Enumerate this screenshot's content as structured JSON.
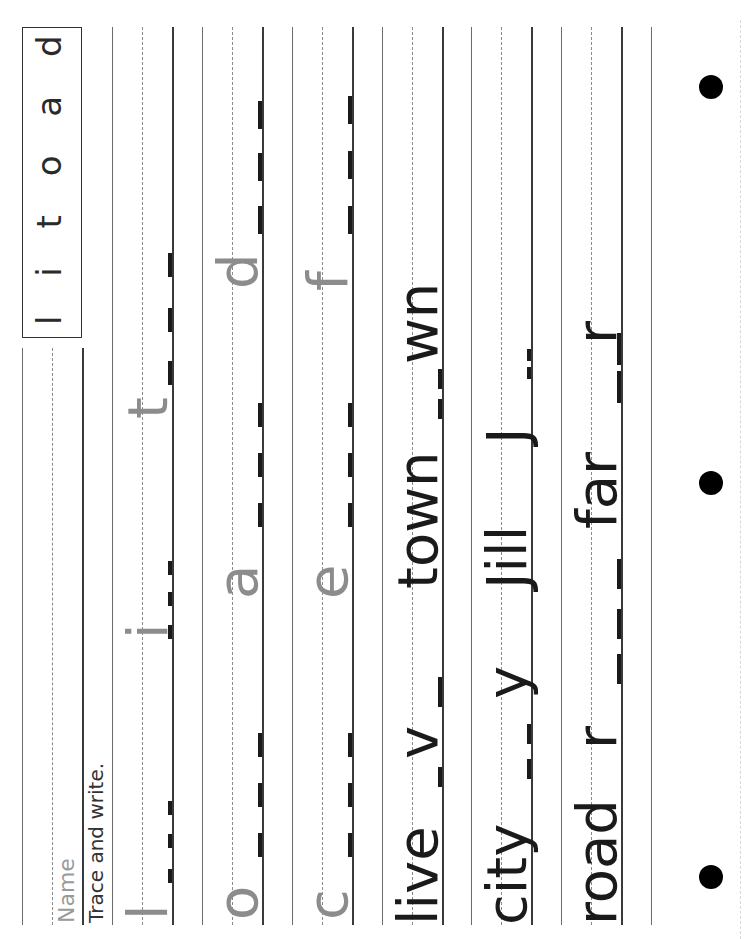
{
  "worksheet": {
    "letter_box": "l i t o a d c e f",
    "name_label": "Name",
    "instruction": "Trace and write."
  },
  "rows": [
    {
      "id": "row-1",
      "items": [
        {
          "text": "l",
          "style": "gray",
          "pos": 19
        },
        {
          "text": "i",
          "style": "gray",
          "pos": 300
        },
        {
          "text": "t",
          "style": "gray",
          "pos": 520
        }
      ]
    },
    {
      "id": "row-2",
      "items": [
        {
          "text": "o",
          "style": "gray",
          "pos": 19
        },
        {
          "text": "a",
          "style": "gray",
          "pos": 340
        },
        {
          "text": "d",
          "style": "gray",
          "pos": 650
        }
      ]
    },
    {
      "id": "row-3",
      "items": [
        {
          "text": "c",
          "style": "gray",
          "pos": 19
        },
        {
          "text": "e",
          "style": "gray",
          "pos": 340
        },
        {
          "text": "f",
          "style": "gray",
          "pos": 648
        }
      ]
    },
    {
      "id": "row-4",
      "items": [
        {
          "text": "live",
          "style": "black",
          "pos": 14
        },
        {
          "text": "v",
          "style": "black",
          "pos": 180
        },
        {
          "text": "town",
          "style": "black",
          "pos": 350
        },
        {
          "text": "wn",
          "style": "black",
          "pos": 575
        }
      ]
    },
    {
      "id": "row-5",
      "items": [
        {
          "text": "city",
          "style": "black",
          "pos": 14
        },
        {
          "text": "y",
          "style": "black",
          "pos": 240
        },
        {
          "text": "Jill",
          "style": "black",
          "pos": 350
        },
        {
          "text": "J",
          "style": "black",
          "pos": 495
        }
      ]
    },
    {
      "id": "row-6",
      "items": [
        {
          "text": "road",
          "style": "black",
          "pos": 14
        },
        {
          "text": "r",
          "style": "black",
          "pos": 190
        },
        {
          "text": "far",
          "style": "black",
          "pos": 410
        },
        {
          "text": "r",
          "style": "black",
          "pos": 595
        }
      ]
    }
  ],
  "colors": {
    "trace_gray": "#8c8c8c",
    "ink": "#1a1a1a",
    "rule": "#6b6b6b"
  }
}
